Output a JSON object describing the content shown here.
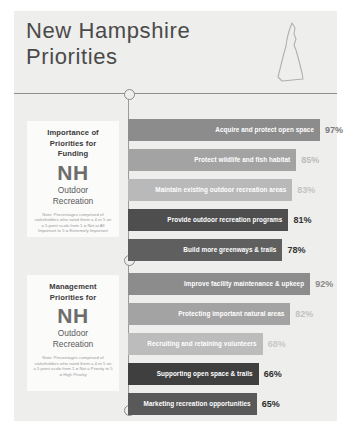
{
  "header": {
    "title": "New Hampshire\nPriorities",
    "map_icon": "new-hampshire-state-outline"
  },
  "cards": [
    {
      "heading": "Importance of\nPriorities for\nFunding",
      "nh": "NH",
      "sub": "Outdoor\nRecreation",
      "note": "Note: Percentages comprised of stakeholders who rated them a 4 or 5 on a 5 point scale from 1 = Not at All Important to 5 = Extremely Important"
    },
    {
      "heading": "Management\nPriorities for",
      "nh": "NH",
      "sub": "Outdoor\nRecreation",
      "note": "Note: Percentages comprised of stakeholders who rated them a 4 or 5 on a 5 point scale from 1 = Not a Priority to 5 = High Priority"
    }
  ],
  "chart_data": {
    "type": "bar",
    "title": "New Hampshire Priorities",
    "orientation": "horizontal",
    "xlabel": "",
    "ylabel": "",
    "xlim": [
      0,
      100
    ],
    "grid": false,
    "legend": "none",
    "series": [
      {
        "name": "Importance of Priorities for Funding NH Outdoor Recreation",
        "categories": [
          "Acquire and protect open space",
          "Protect wildlife and fish habitat",
          "Maintain existing outdoor recreation areas",
          "Provide outdoor recreation programs",
          "Build more greenways & trails"
        ],
        "values": [
          97,
          85,
          83,
          81,
          78
        ],
        "value_labels": [
          "97%",
          "85%",
          "83%",
          "81%",
          "78%"
        ],
        "bar_colors": [
          "#8c8c8c",
          "#a3a3a3",
          "#b9b9b9",
          "#4e4e4e",
          "#5f5f5f"
        ],
        "value_colors": [
          "#7a7a7a",
          "#bdbdbd",
          "#c4c4c4",
          "#333333",
          "#333333"
        ]
      },
      {
        "name": "Management Priorities for NH Outdoor Recreation",
        "categories": [
          "Improve facility maintenance & upkeep",
          "Protecting important natural areas",
          "Recruiting and retaining volunteers",
          "Supporting open space & trails",
          "Marketing recreation opportunities"
        ],
        "values": [
          92,
          82,
          68,
          66,
          65
        ],
        "value_labels": [
          "92%",
          "82%",
          "68%",
          "66%",
          "65%"
        ],
        "bar_colors": [
          "#8c8c8c",
          "#a3a3a3",
          "#bcbcbc",
          "#3f3f3f",
          "#595959"
        ],
        "value_colors": [
          "#8a8a8a",
          "#c2c2c2",
          "#c8c8c8",
          "#2e2e2e",
          "#2e2e2e"
        ]
      }
    ]
  }
}
